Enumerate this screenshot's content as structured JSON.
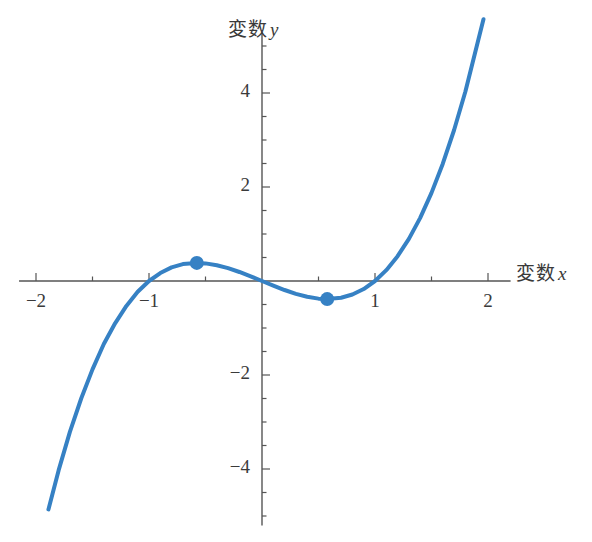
{
  "chart_data": {
    "type": "line",
    "title": "",
    "xlabel": "変数 x",
    "ylabel": "変数 y",
    "xlabel_text": "変数",
    "xlabel_symbol": "x",
    "ylabel_text": "変数",
    "ylabel_symbol": "y",
    "function": "y = x^3 - x",
    "xlim": [
      -2.15,
      2.2
    ],
    "ylim": [
      -5.2,
      5.3
    ],
    "xticks": [
      -2,
      -1,
      1,
      2
    ],
    "xtick_labels": [
      "−2",
      "−1",
      "1",
      "2"
    ],
    "yticks": [
      4,
      2,
      -2,
      -4
    ],
    "ytick_labels": [
      "4",
      "2",
      "−2",
      "−4"
    ],
    "minor_tick_step": 0.5,
    "grid": false,
    "legend": null,
    "series": [
      {
        "name": "y = x^3 - x",
        "color": "#3681c4",
        "line_width": 4,
        "x_start": -1.89,
        "x_end": 1.96,
        "points": [
          {
            "x": -1.89,
            "y": -4.86
          },
          {
            "x": -1.8,
            "y": -4.03
          },
          {
            "x": -1.7,
            "y": -3.21
          },
          {
            "x": -1.6,
            "y": -2.5
          },
          {
            "x": -1.5,
            "y": -1.88
          },
          {
            "x": -1.4,
            "y": -1.34
          },
          {
            "x": -1.3,
            "y": -0.9
          },
          {
            "x": -1.2,
            "y": -0.53
          },
          {
            "x": -1.1,
            "y": -0.23
          },
          {
            "x": -1.0,
            "y": 0.0
          },
          {
            "x": -0.9,
            "y": 0.17
          },
          {
            "x": -0.8,
            "y": 0.29
          },
          {
            "x": -0.7,
            "y": 0.36
          },
          {
            "x": -0.577,
            "y": 0.385
          },
          {
            "x": -0.5,
            "y": 0.375
          },
          {
            "x": -0.4,
            "y": 0.336
          },
          {
            "x": -0.3,
            "y": 0.273
          },
          {
            "x": -0.2,
            "y": 0.192
          },
          {
            "x": -0.1,
            "y": 0.099
          },
          {
            "x": 0.0,
            "y": 0.0
          },
          {
            "x": 0.1,
            "y": -0.099
          },
          {
            "x": 0.2,
            "y": -0.192
          },
          {
            "x": 0.3,
            "y": -0.273
          },
          {
            "x": 0.4,
            "y": -0.336
          },
          {
            "x": 0.5,
            "y": -0.375
          },
          {
            "x": 0.577,
            "y": -0.385
          },
          {
            "x": 0.7,
            "y": -0.357
          },
          {
            "x": 0.8,
            "y": -0.288
          },
          {
            "x": 0.9,
            "y": -0.171
          },
          {
            "x": 1.0,
            "y": 0.0
          },
          {
            "x": 1.1,
            "y": 0.231
          },
          {
            "x": 1.2,
            "y": 0.528
          },
          {
            "x": 1.3,
            "y": 0.897
          },
          {
            "x": 1.4,
            "y": 1.344
          },
          {
            "x": 1.5,
            "y": 1.875
          },
          {
            "x": 1.6,
            "y": 2.496
          },
          {
            "x": 1.7,
            "y": 3.213
          },
          {
            "x": 1.8,
            "y": 4.032
          },
          {
            "x": 1.96,
            "y": 5.57
          }
        ]
      }
    ],
    "markers": [
      {
        "name": "local-maximum",
        "x": -0.577,
        "y": 0.385,
        "color": "#3681c4",
        "radius": 7
      },
      {
        "name": "local-minimum",
        "x": 0.577,
        "y": -0.385,
        "color": "#3681c4",
        "radius": 7
      }
    ],
    "axis_color": "#555555",
    "text_color": "#3a3a3a",
    "background": "#ffffff"
  }
}
